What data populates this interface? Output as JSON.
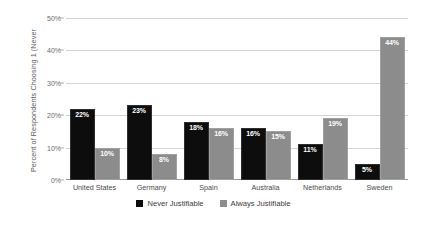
{
  "chart_data": {
    "type": "bar",
    "title": "",
    "xlabel": "",
    "ylabel": "Percent of Respondents Choosing 1 (Never",
    "ylim": [
      0,
      50
    ],
    "ytick_labels": [
      "0%",
      "10%",
      "20%",
      "30%",
      "40%",
      "50%"
    ],
    "ytick_values": [
      0,
      10,
      20,
      30,
      40,
      50
    ],
    "grid": true,
    "legend_position": "bottom",
    "categories": [
      "United States",
      "Germany",
      "Spain",
      "Australia",
      "Netherlands",
      "Sweden"
    ],
    "series": [
      {
        "name": "Never Justifiable",
        "color": "#0d0d0d",
        "values": [
          22,
          23,
          18,
          16,
          11,
          5
        ],
        "labels": [
          "22%",
          "23%",
          "18%",
          "16%",
          "11%",
          "5%"
        ]
      },
      {
        "name": "Always Justifiable",
        "color": "#8c8c8c",
        "values": [
          10,
          8,
          16,
          15,
          19,
          44
        ],
        "labels": [
          "10%",
          "8%",
          "16%",
          "15%",
          "19%",
          "44%"
        ]
      }
    ]
  },
  "legend": {
    "items": [
      {
        "label": "Never Justifiable",
        "color": "#0d0d0d"
      },
      {
        "label": "Always Justifiable",
        "color": "#8c8c8c"
      }
    ]
  }
}
